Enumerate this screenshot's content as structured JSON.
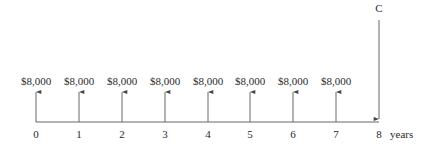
{
  "diagram": {
    "type": "cash-flow-timeline",
    "axis_unit": "years",
    "periods": [
      "0",
      "1",
      "2",
      "3",
      "4",
      "5",
      "6",
      "7",
      "8"
    ],
    "inflows": [
      {
        "period": "0",
        "amount": "$8,000"
      },
      {
        "period": "1",
        "amount": "$8,000"
      },
      {
        "period": "2",
        "amount": "$8,000"
      },
      {
        "period": "3",
        "amount": "$8,000"
      },
      {
        "period": "4",
        "amount": "$8,000"
      },
      {
        "period": "5",
        "amount": "$8,000"
      },
      {
        "period": "6",
        "amount": "$8,000"
      },
      {
        "period": "7",
        "amount": "$8,000"
      }
    ],
    "outflow": {
      "period": "8",
      "label": "C"
    },
    "colors": {
      "line": "#555555",
      "text": "#2a2a2a"
    }
  }
}
